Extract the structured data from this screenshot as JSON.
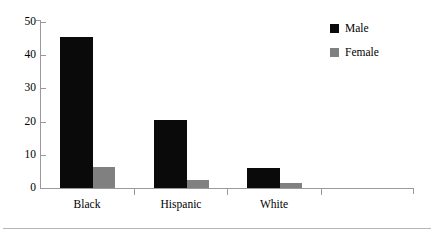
{
  "chart_data": {
    "type": "bar",
    "title": "",
    "subtitle": "",
    "xlabel": "",
    "ylabel": "",
    "categories": [
      "Black",
      "Hispanic",
      "White",
      ""
    ],
    "series": [
      {
        "name": "Male",
        "color": "#0a0a0a",
        "values": [
          45.5,
          20.5,
          6.0,
          null
        ]
      },
      {
        "name": "Female",
        "color": "#808080",
        "values": [
          6.3,
          2.4,
          1.5,
          null
        ]
      }
    ],
    "ylim": [
      0,
      50
    ],
    "yticks": [
      0,
      10,
      20,
      30,
      40,
      50
    ],
    "ytick_labels": [
      "0",
      "10",
      "20",
      "30",
      "40",
      "50"
    ],
    "grid": false,
    "legend_position": "top-right",
    "legend_entries": [
      "Male",
      "Female"
    ],
    "annotations": []
  },
  "axis": {
    "line_color": "#9a9a9a"
  },
  "colors": {
    "male": "#0a0a0a",
    "female": "#808080",
    "axis": "#9a9a9a",
    "rule": "#b5b5b5"
  }
}
